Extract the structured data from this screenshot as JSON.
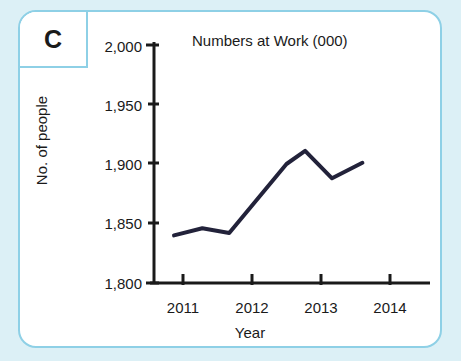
{
  "panel": {
    "letter": "C",
    "border_color": "#8ed0e6",
    "background_color": "#ffffff",
    "page_background_color": "#dcf0f6"
  },
  "chart_data": {
    "type": "line",
    "title": "Numbers at Work (000)",
    "xlabel": "Year",
    "ylabel": "No. of people",
    "grid": false,
    "legend": false,
    "line_color": "#22223a",
    "xlim": [
      2010.6,
      2014.5
    ],
    "ylim": [
      1800,
      2000
    ],
    "x_ticks": [
      2011,
      2012,
      2013,
      2014
    ],
    "x_tick_labels": [
      "2011",
      "2012",
      "2013",
      "2014"
    ],
    "y_ticks": [
      1800,
      1850,
      1900,
      1950,
      2000
    ],
    "y_tick_labels": [
      "1,800",
      "1,850",
      "1,900",
      "1,950",
      "2,000"
    ],
    "series": [
      {
        "name": "Numbers at Work (000)",
        "x": [
          2010.87,
          2011.28,
          2011.67,
          2012.5,
          2012.77,
          2013.16,
          2013.6
        ],
        "values": [
          1840,
          1846,
          1842,
          1900,
          1911,
          1888,
          1901
        ]
      }
    ]
  }
}
